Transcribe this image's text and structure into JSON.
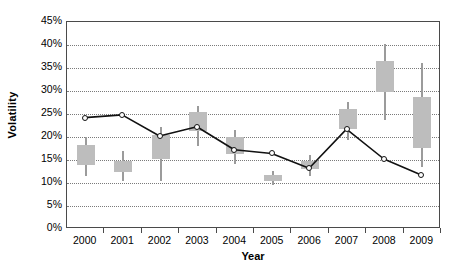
{
  "chart_data": {
    "type": "bar",
    "title": "",
    "xlabel": "Year",
    "ylabel": "Volatility",
    "categories": [
      "2000",
      "2001",
      "2002",
      "2003",
      "2004",
      "2005",
      "2006",
      "2007",
      "2008",
      "2009"
    ],
    "ytick_labels": [
      "0%",
      "5%",
      "10%",
      "15%",
      "20%",
      "25%",
      "30%",
      "35%",
      "40%",
      "45%"
    ],
    "ytick_values": [
      0,
      5,
      10,
      15,
      20,
      25,
      30,
      35,
      40,
      45
    ],
    "ylim": [
      0,
      45
    ],
    "grid": true,
    "legend": "none",
    "series": [
      {
        "name": "Volatility (line)",
        "type": "line",
        "marker": "open-circle",
        "color": "#111111",
        "values": [
          24.0,
          24.6,
          20.0,
          22.0,
          17.0,
          16.2,
          13.0,
          21.5,
          15.0,
          11.5
        ]
      },
      {
        "name": "Volatility range (box-whisker)",
        "type": "box",
        "color": "#bdbdbd",
        "whisker_color": "#9b9b9b",
        "boxes": [
          {
            "year": "2000",
            "whisker_low": 11.6,
            "box_low": 14.0,
            "box_high": 18.3,
            "whisker_high": 20.0
          },
          {
            "year": "2001",
            "whisker_low": 10.5,
            "box_low": 12.3,
            "box_high": 14.8,
            "whisker_high": 17.0
          },
          {
            "year": "2002",
            "whisker_low": 10.4,
            "box_low": 15.2,
            "box_high": 20.5,
            "whisker_high": 22.2
          },
          {
            "year": "2003",
            "whisker_low": 18.0,
            "box_low": 21.3,
            "box_high": 25.4,
            "whisker_high": 26.8
          },
          {
            "year": "2004",
            "whisker_low": 14.2,
            "box_low": 16.4,
            "box_high": 20.0,
            "whisker_high": 21.5
          },
          {
            "year": "2005",
            "whisker_low": 9.6,
            "box_low": 10.4,
            "box_high": 11.8,
            "whisker_high": 12.6
          },
          {
            "year": "2006",
            "whisker_low": 11.6,
            "box_low": 13.0,
            "box_high": 14.7,
            "whisker_high": 16.0
          },
          {
            "year": "2007",
            "whisker_low": 19.4,
            "box_low": 21.7,
            "box_high": 26.0,
            "whisker_high": 27.6
          },
          {
            "year": "2008",
            "whisker_low": 23.7,
            "box_low": 29.7,
            "box_high": 36.6,
            "whisker_high": 40.3
          },
          {
            "year": "2009",
            "whisker_low": 13.5,
            "box_low": 17.6,
            "box_high": 28.6,
            "whisker_high": 36.0
          }
        ]
      }
    ]
  }
}
